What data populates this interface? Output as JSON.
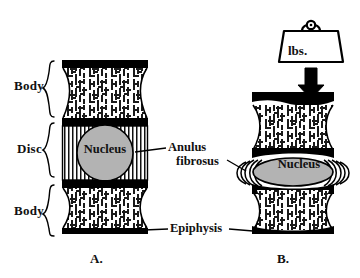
{
  "figure": {
    "panels": [
      {
        "id": "A",
        "caption": "A.",
        "state": "unloaded",
        "regions": [
          {
            "name": "Body",
            "label": "Body"
          },
          {
            "name": "Disc",
            "label": "Disc"
          },
          {
            "name": "Body",
            "label": "Body"
          }
        ],
        "nucleus_label": "Nucleus",
        "nucleus_shape": "circle"
      },
      {
        "id": "B",
        "caption": "B.",
        "state": "loaded",
        "load": {
          "weight_label": "lbs.",
          "arrow": "down-arrow"
        },
        "nucleus_label": "Nucleus",
        "nucleus_shape": "flattened-ellipse"
      }
    ],
    "callouts": [
      {
        "name": "anulus-fibrosus",
        "line1": "Anulus",
        "line2": "fibrosus"
      },
      {
        "name": "epiphysis",
        "text": "Epiphysis"
      }
    ],
    "colors": {
      "ink": "#000000",
      "nucleus_fill": "#b3b3b3",
      "bone_fill": "#ffffff",
      "endplate": "#000000",
      "background": "#ffffff"
    }
  }
}
